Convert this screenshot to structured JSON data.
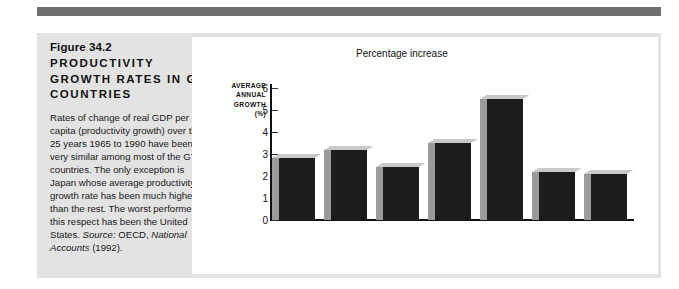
{
  "figure": {
    "number": "Figure 34.2",
    "title": "PRODUCTIVITY GROWTH RATES IN G7 COUNTRIES",
    "caption_body": "Rates of change of real GDP per capita (productivity growth) over the 25 years 1965 to 1990 have been very similar among most of the G7 countries. The only exception is Japan whose average productivity growth rate has been much higher than the rest. The worst performer in this respect has been the United States.",
    "source_lead": "Source:",
    "source_text": "OECD,",
    "source_italic": "National Accounts",
    "source_year": "(1992)."
  },
  "colors": {
    "panel_background": "#e3e3e3",
    "top_rule": "#6e6e6e",
    "bar_face": "#1c1c1c",
    "bar_side": "#9a9a9a",
    "bar_top": "#c9c9c9",
    "axis": "#111111",
    "plot_background": "#ffffff"
  },
  "chart_data": {
    "type": "bar",
    "title": "",
    "annotation": "Percentage increase",
    "axis_caption_lines": [
      "AVERAGE",
      "ANNUAL",
      "GROWTH",
      "(%)"
    ],
    "ylabel": "AVERAGE ANNUAL GROWTH (%)",
    "xlabel": "",
    "ylim": [
      0,
      6
    ],
    "yticks": [
      0,
      1,
      2,
      3,
      4,
      5,
      6
    ],
    "ytick_labels": [
      "0",
      "1",
      "2",
      "3",
      "4",
      "5",
      "6"
    ],
    "grid": false,
    "legend": "none",
    "categories": [
      "Canada",
      "France",
      "Germany",
      "Italy",
      "Japan",
      "U.K.",
      "U.S."
    ],
    "values": [
      2.8,
      3.2,
      2.4,
      3.5,
      5.5,
      2.2,
      2.1
    ]
  }
}
